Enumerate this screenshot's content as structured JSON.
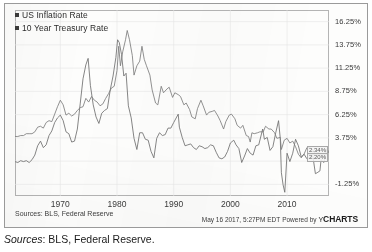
{
  "caption": {
    "lead": "Sources",
    "rest": ": BLS, Federal Reserve."
  },
  "footer": {
    "source_note": "Sources: BLS, Federal Reserve",
    "timestamp": "May 16 2017, 5:27PM EDT",
    "powered_by": "Powered by",
    "brand_y": "Y",
    "brand_charts": "CHARTS"
  },
  "callouts": {
    "treasury_last": "2.34%",
    "inflation_last": "2.20%"
  },
  "colors": {
    "inflation_line": "#6f6f6f",
    "treasury_line": "#7d7d7d",
    "legend_swatch": "#3a3a3a",
    "axis": "#b4b4b4",
    "grid": "#e4e4e4",
    "text": "#3a3a3a",
    "card_border": "#9a9a9a",
    "background": "#fdfdfc"
  },
  "chart_data": {
    "type": "line",
    "title": "",
    "xlabel": "",
    "ylabel": "",
    "grid": true,
    "legend_position": "top-left",
    "xlim": [
      1962,
      2017.4
    ],
    "ylim": [
      -2.5,
      17.5
    ],
    "xticks": [
      1970,
      1980,
      1990,
      2000,
      2010
    ],
    "xticklabels": [
      "1970",
      "1980",
      "1990",
      "2000",
      "2010"
    ],
    "yticks": [
      -1.25,
      1.25,
      3.75,
      6.25,
      8.75,
      11.25,
      13.75,
      16.25
    ],
    "yticklabels": [
      "-1.25%",
      "",
      "3.75%",
      "6.25%",
      "8.75%",
      "11.25%",
      "13.75%",
      "16.25%"
    ],
    "ytick_visible": [
      "16.25%",
      "13.75%",
      "11.25%",
      "8.75%",
      "6.25%",
      "3.75%",
      "-1.25%"
    ],
    "series": [
      {
        "name": "US Inflation Rate",
        "color": "#6f6f6f",
        "x": [
          1962.0,
          1962.5,
          1963.0,
          1963.5,
          1964.0,
          1964.5,
          1965.0,
          1965.5,
          1966.0,
          1966.5,
          1967.0,
          1967.5,
          1968.0,
          1968.5,
          1969.0,
          1969.5,
          1970.0,
          1970.5,
          1971.0,
          1971.5,
          1972.0,
          1972.5,
          1973.0,
          1973.5,
          1974.0,
          1974.5,
          1974.9,
          1975.3,
          1975.8,
          1976.3,
          1976.8,
          1977.3,
          1977.8,
          1978.3,
          1978.8,
          1979.3,
          1979.8,
          1980.1,
          1980.4,
          1980.8,
          1981.2,
          1981.6,
          1982.0,
          1982.5,
          1983.0,
          1983.5,
          1984.0,
          1984.5,
          1985.0,
          1985.5,
          1986.0,
          1986.5,
          1987.0,
          1987.5,
          1988.0,
          1988.5,
          1989.0,
          1989.5,
          1990.0,
          1990.8,
          1991.0,
          1991.5,
          1992.0,
          1992.5,
          1993.0,
          1993.5,
          1994.0,
          1994.5,
          1995.0,
          1995.5,
          1996.0,
          1996.5,
          1997.0,
          1997.5,
          1998.0,
          1998.5,
          1999.0,
          1999.5,
          2000.0,
          2000.6,
          2001.0,
          2001.5,
          2002.0,
          2002.5,
          2003.0,
          2003.5,
          2004.0,
          2004.5,
          2005.0,
          2005.7,
          2006.0,
          2006.5,
          2007.0,
          2007.5,
          2008.0,
          2008.5,
          2008.8,
          2009.0,
          2009.3,
          2009.6,
          2010.0,
          2010.5,
          2011.0,
          2011.5,
          2012.0,
          2012.5,
          2013.0,
          2013.5,
          2014.0,
          2014.5,
          2015.0,
          2015.3,
          2015.8,
          2016.0,
          2016.5,
          2017.0,
          2017.3
        ],
        "y": [
          1.2,
          1.1,
          1.3,
          1.2,
          1.3,
          1.1,
          1.4,
          1.9,
          2.9,
          3.4,
          2.7,
          3.0,
          4.0,
          4.5,
          5.4,
          5.9,
          6.2,
          5.6,
          4.4,
          4.2,
          3.3,
          3.4,
          4.7,
          7.4,
          10.1,
          11.6,
          12.3,
          9.4,
          7.3,
          6.0,
          5.3,
          6.4,
          6.7,
          6.9,
          8.9,
          10.4,
          12.4,
          14.3,
          14.0,
          12.7,
          10.4,
          10.7,
          7.2,
          5.9,
          3.7,
          2.5,
          4.3,
          4.3,
          3.6,
          3.5,
          2.3,
          1.6,
          3.7,
          4.3,
          4.0,
          4.1,
          4.8,
          4.8,
          5.4,
          6.3,
          4.9,
          3.8,
          2.9,
          3.0,
          3.1,
          2.7,
          2.5,
          2.9,
          2.8,
          2.6,
          2.7,
          3.0,
          2.9,
          2.2,
          1.6,
          1.5,
          1.7,
          2.3,
          3.2,
          3.5,
          3.0,
          2.6,
          1.1,
          1.8,
          2.6,
          2.1,
          1.9,
          2.9,
          3.0,
          4.7,
          3.6,
          3.8,
          2.4,
          2.8,
          4.3,
          5.6,
          3.7,
          0.0,
          -1.3,
          -2.1,
          2.1,
          1.2,
          2.1,
          3.6,
          2.9,
          1.7,
          2.0,
          1.5,
          1.6,
          2.0,
          -0.1,
          0.0,
          0.2,
          1.4,
          1.1,
          2.5,
          2.2
        ],
        "last_value": 2.2
      },
      {
        "name": "10 Year Treasury Rate",
        "color": "#7d7d7d",
        "x": [
          1962.0,
          1962.5,
          1963.0,
          1963.5,
          1964.0,
          1964.5,
          1965.0,
          1965.5,
          1966.0,
          1966.5,
          1967.0,
          1967.5,
          1968.0,
          1968.5,
          1969.0,
          1969.5,
          1970.0,
          1970.5,
          1971.0,
          1971.5,
          1972.0,
          1972.5,
          1973.0,
          1973.5,
          1974.0,
          1974.5,
          1975.0,
          1975.5,
          1976.0,
          1976.5,
          1977.0,
          1977.5,
          1978.0,
          1978.5,
          1979.0,
          1979.5,
          1980.0,
          1980.3,
          1980.6,
          1981.0,
          1981.5,
          1981.8,
          1982.2,
          1982.7,
          1983.0,
          1983.5,
          1984.0,
          1984.4,
          1984.8,
          1985.2,
          1985.8,
          1986.2,
          1986.8,
          1987.2,
          1987.8,
          1988.2,
          1988.8,
          1989.2,
          1989.8,
          1990.2,
          1990.8,
          1991.2,
          1991.8,
          1992.2,
          1992.8,
          1993.2,
          1993.8,
          1994.2,
          1994.8,
          1995.2,
          1995.8,
          1996.2,
          1996.8,
          1997.2,
          1997.8,
          1998.2,
          1998.8,
          1999.2,
          1999.8,
          2000.2,
          2000.8,
          2001.2,
          2001.8,
          2002.2,
          2002.8,
          2003.2,
          2003.5,
          2003.8,
          2004.2,
          2004.8,
          2005.2,
          2005.8,
          2006.2,
          2006.8,
          2007.2,
          2007.8,
          2008.2,
          2008.8,
          2009.0,
          2009.5,
          2010.0,
          2010.5,
          2011.0,
          2011.5,
          2012.0,
          2012.5,
          2013.0,
          2013.5,
          2014.0,
          2014.5,
          2015.0,
          2015.5,
          2016.0,
          2016.5,
          2016.8,
          2017.0,
          2017.3
        ],
        "y": [
          3.9,
          3.9,
          4.0,
          4.0,
          4.2,
          4.2,
          4.2,
          4.4,
          4.9,
          5.0,
          4.8,
          5.4,
          5.6,
          5.5,
          6.3,
          7.1,
          7.8,
          7.3,
          6.2,
          6.4,
          6.1,
          6.3,
          6.7,
          7.0,
          7.1,
          8.0,
          7.6,
          8.2,
          7.8,
          7.6,
          7.2,
          7.4,
          8.0,
          8.5,
          9.1,
          9.3,
          11.0,
          13.6,
          11.5,
          13.0,
          14.3,
          15.3,
          14.3,
          12.6,
          10.5,
          11.5,
          12.0,
          13.6,
          12.2,
          11.5,
          10.5,
          8.9,
          7.5,
          7.3,
          9.3,
          8.6,
          9.0,
          9.2,
          8.1,
          8.6,
          8.4,
          8.2,
          7.3,
          7.5,
          6.8,
          6.0,
          5.8,
          6.9,
          7.8,
          7.2,
          6.2,
          6.5,
          6.6,
          6.7,
          6.1,
          5.6,
          4.7,
          5.5,
          6.2,
          6.3,
          5.8,
          5.1,
          4.8,
          5.1,
          4.0,
          3.9,
          3.3,
          4.3,
          4.2,
          4.3,
          4.4,
          4.4,
          5.0,
          4.7,
          4.7,
          4.3,
          3.7,
          3.8,
          2.5,
          3.5,
          3.7,
          3.2,
          3.4,
          2.8,
          2.0,
          1.6,
          2.0,
          2.7,
          2.7,
          2.5,
          2.0,
          2.2,
          1.9,
          1.6,
          2.4,
          2.4,
          2.34
        ],
        "last_value": 2.34
      }
    ]
  },
  "legend": {
    "items": [
      {
        "label": "US Inflation Rate"
      },
      {
        "label": "10 Year Treasury Rate"
      }
    ]
  }
}
